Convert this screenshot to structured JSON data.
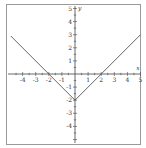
{
  "chart_data": {
    "type": "line",
    "title": "",
    "function": "y = |x| - 2",
    "xlabel": "x",
    "ylabel": "y",
    "xlim": [
      -5,
      5
    ],
    "ylim": [
      -5,
      5
    ],
    "grid": false,
    "x_ticks": [
      "-4",
      "-3",
      "-2",
      "-1",
      "1",
      "2",
      "3",
      "4",
      "5"
    ],
    "y_ticks": [
      "5",
      "4",
      "3",
      "2",
      "1",
      "-1",
      "-2",
      "-3",
      "-4"
    ],
    "series": [
      {
        "name": "y = |x| - 2",
        "x": [
          -4.9,
          -2,
          0,
          2,
          5
        ],
        "y": [
          2.9,
          0,
          -2,
          0,
          3
        ]
      }
    ],
    "line_color": "#555555"
  }
}
